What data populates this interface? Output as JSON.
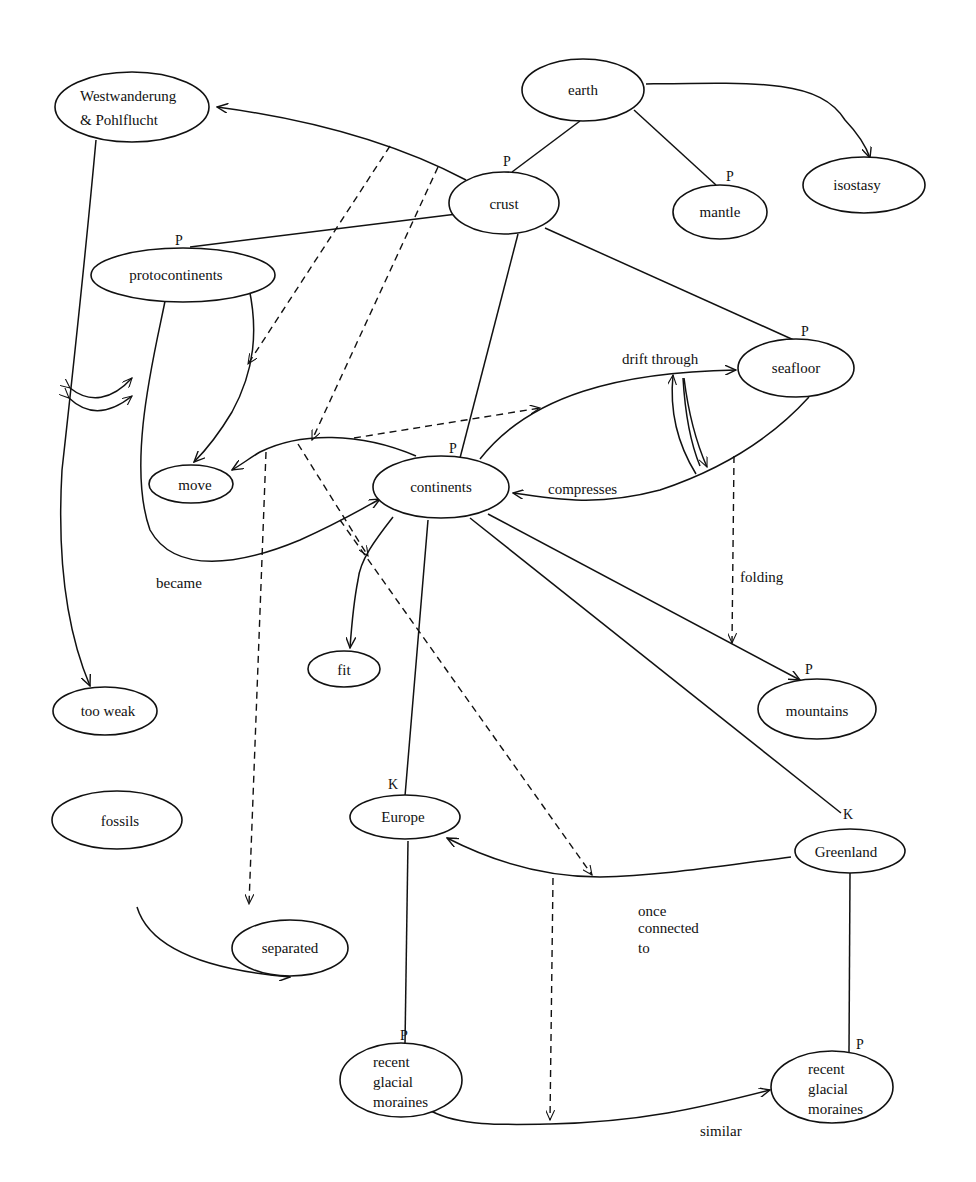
{
  "diagram": {
    "type": "concept-map",
    "nodes": {
      "westwanderung": {
        "line1": "Westwanderung",
        "line2": "&  Pohlflucht"
      },
      "earth": {
        "label": "earth"
      },
      "crust": {
        "label": "crust",
        "marker": "P"
      },
      "mantle": {
        "label": "mantle",
        "marker": "P"
      },
      "isostasy": {
        "label": "isostasy"
      },
      "protocontinents": {
        "label": "protocontinents",
        "marker": "P"
      },
      "seafloor": {
        "label": "seafloor",
        "marker": "P"
      },
      "move": {
        "label": "move"
      },
      "continents": {
        "label": "continents",
        "marker": "P"
      },
      "fit": {
        "label": "fit"
      },
      "too_weak": {
        "label": "too weak"
      },
      "mountains": {
        "label": "mountains",
        "marker": "P"
      },
      "fossils": {
        "label": "fossils"
      },
      "europe": {
        "label": "Europe",
        "marker": "K"
      },
      "greenland": {
        "label": "Greenland",
        "marker": "K"
      },
      "separated": {
        "label": "separated"
      },
      "moraines_left": {
        "line1": "recent",
        "line2": "glacial",
        "line3": "moraines",
        "marker": "P"
      },
      "moraines_right": {
        "line1": "recent",
        "line2": "glacial",
        "line3": "moraines",
        "marker": "P"
      }
    },
    "edge_labels": {
      "drift_through": "drift through",
      "compresses": "compresses",
      "became": "became",
      "folding": "folding",
      "once_connected_1": "once",
      "once_connected_2": "connected",
      "once_connected_3": "to",
      "similar": "similar"
    },
    "edges": [
      {
        "from": "earth",
        "to": "crust",
        "style": "solid"
      },
      {
        "from": "earth",
        "to": "mantle",
        "style": "solid"
      },
      {
        "from": "earth",
        "to": "isostasy",
        "style": "arrow"
      },
      {
        "from": "crust",
        "to": "westwanderung",
        "style": "arrow"
      },
      {
        "from": "crust",
        "to": "protocontinents",
        "style": "solid"
      },
      {
        "from": "crust",
        "to": "continents",
        "style": "solid"
      },
      {
        "from": "crust",
        "to": "seafloor",
        "style": "solid"
      },
      {
        "from": "continents",
        "to": "seafloor",
        "style": "arrow",
        "label": "drift through"
      },
      {
        "from": "seafloor",
        "to": "continents",
        "style": "arrow",
        "label": "compresses"
      },
      {
        "from": "protocontinents",
        "to": "continents",
        "style": "arrow",
        "label": "became"
      },
      {
        "from": "protocontinents",
        "to": "move",
        "style": "arrow"
      },
      {
        "from": "continents",
        "to": "move",
        "style": "arrow"
      },
      {
        "from": "continents",
        "to": "fit",
        "style": "arrow"
      },
      {
        "from": "continents",
        "to": "mountains",
        "style": "arrow"
      },
      {
        "from": "continents",
        "to": "europe",
        "style": "solid"
      },
      {
        "from": "continents",
        "to": "greenland",
        "style": "solid"
      },
      {
        "from": "westwanderung",
        "to": "too_weak",
        "style": "arrow"
      },
      {
        "from": "fossils",
        "to": "separated",
        "style": "arrow"
      },
      {
        "from": "greenland",
        "to": "europe",
        "style": "arrow",
        "label": "once connected to"
      },
      {
        "from": "europe",
        "to": "moraines_left",
        "style": "solid"
      },
      {
        "from": "greenland",
        "to": "moraines_right",
        "style": "solid"
      },
      {
        "from": "moraines_left",
        "to": "moraines_right",
        "style": "arrow",
        "label": "similar"
      }
    ]
  }
}
